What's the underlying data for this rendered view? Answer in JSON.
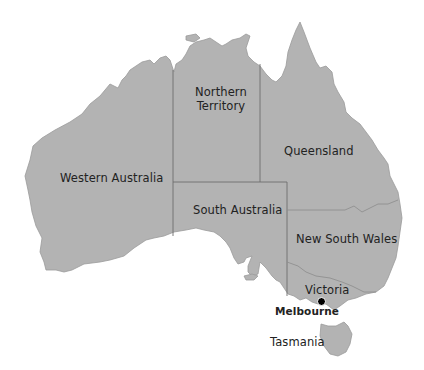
{
  "map": {
    "country": "Australia",
    "colors": {
      "land": "#b3b3b3",
      "border": "#6e6e6e",
      "water": "#ffffff",
      "text": "#222222",
      "city_marker": "#000000"
    },
    "regions": [
      {
        "id": "wa",
        "label": "Western Australia"
      },
      {
        "id": "nt",
        "label_line1": "Northern",
        "label_line2": "Territory"
      },
      {
        "id": "qld",
        "label": "Queensland"
      },
      {
        "id": "sa",
        "label": "South Australia"
      },
      {
        "id": "nsw",
        "label": "New South Wales"
      },
      {
        "id": "vic",
        "label": "Victoria"
      },
      {
        "id": "tas",
        "label": "Tasmania"
      }
    ],
    "cities": [
      {
        "id": "melbourne",
        "label": "Melbourne",
        "marker_icon": "city-dot-icon"
      }
    ]
  }
}
